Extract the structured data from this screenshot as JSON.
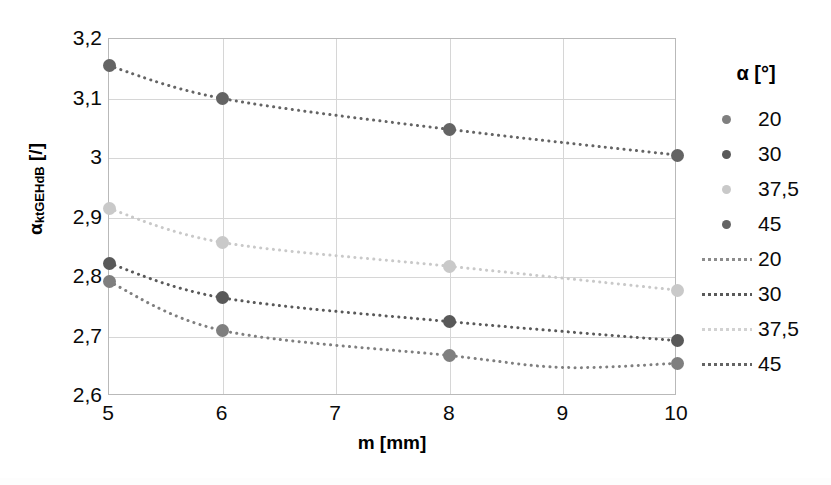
{
  "chart_data": {
    "type": "scatter",
    "title": "",
    "xlabel": "m [mm]",
    "ylabel": "α_ktGEHdB [/]",
    "ylabel_base": "α",
    "ylabel_sub": "ktGEHdB",
    "ylabel_unit": " [/]",
    "x": [
      5,
      6,
      8,
      10
    ],
    "xlim": [
      5,
      10
    ],
    "ylim": [
      2.6,
      3.2
    ],
    "xticks": [
      "5",
      "6",
      "7",
      "8",
      "9",
      "10"
    ],
    "xtick_values": [
      5,
      6,
      7,
      8,
      9,
      10
    ],
    "yticks": [
      "2,6",
      "2,7",
      "2,8",
      "2,9",
      "3",
      "3,1",
      "3,2"
    ],
    "ytick_values": [
      2.6,
      2.7,
      2.8,
      2.9,
      3.0,
      3.1,
      3.2
    ],
    "grid": true,
    "legend_position": "right",
    "legend_title": "α [°]",
    "decimal_separator": ",",
    "series": [
      {
        "name": "20",
        "label": "20",
        "color": "#7f7f7f",
        "line_style": "dotted",
        "values": [
          2.792,
          2.71,
          2.668,
          2.655
        ],
        "trend_min_x": 9.0,
        "trend_min_y": 2.648
      },
      {
        "name": "30",
        "label": "30",
        "color": "#595959",
        "line_style": "dotted",
        "values": [
          2.823,
          2.765,
          2.725,
          2.693
        ],
        "trend_min_x": 10.0,
        "trend_min_y": 2.693
      },
      {
        "name": "37,5",
        "label": "37,5",
        "color": "#c9c9c9",
        "line_style": "dotted",
        "values": [
          2.915,
          2.858,
          2.818,
          2.778
        ],
        "trend_min_x": 10.0,
        "trend_min_y": 2.778
      },
      {
        "name": "45",
        "label": "45",
        "color": "#646464",
        "line_style": "dotted",
        "values": [
          3.155,
          3.1,
          3.048,
          3.005
        ],
        "trend_min_x": 10.0,
        "trend_min_y": 3.005
      }
    ],
    "legend_entries": [
      {
        "label": "20",
        "kind": "marker",
        "color": "#7f7f7f"
      },
      {
        "label": "30",
        "kind": "marker",
        "color": "#595959"
      },
      {
        "label": "37,5",
        "kind": "marker",
        "color": "#c9c9c9"
      },
      {
        "label": "45",
        "kind": "marker",
        "color": "#646464"
      },
      {
        "label": "20",
        "kind": "line",
        "color": "#8c8c8c"
      },
      {
        "label": "30",
        "kind": "line",
        "color": "#595959"
      },
      {
        "label": "37,5",
        "kind": "line",
        "color": "#d2d2d2"
      },
      {
        "label": "45",
        "kind": "line",
        "color": "#646464"
      }
    ]
  }
}
